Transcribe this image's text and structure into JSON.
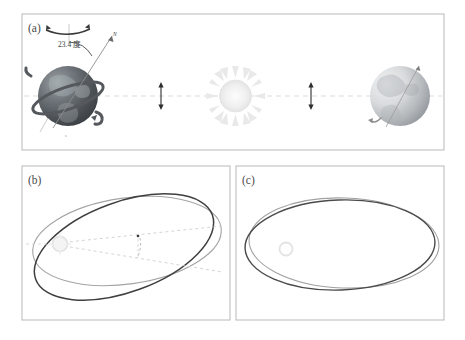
{
  "figure": {
    "background_color": "#ffffff",
    "border_color": "#b9b9b9"
  },
  "panels": [
    {
      "id": "a",
      "label": "(a)",
      "caption": "Earth axial tilt and orbit around the Sun",
      "annotations": {
        "tilt_angle": "23.4 度",
        "north_axis": "N",
        "rotation_arrow": "spin-arrow",
        "orbit_line": "dashed-orbit-line"
      },
      "bodies": [
        {
          "name": "earth-left",
          "kind": "earth",
          "shading": "dark",
          "has_ring": true,
          "has_axis": true
        },
        {
          "name": "sun-center",
          "kind": "sun",
          "shading": "light"
        },
        {
          "name": "earth-right",
          "kind": "earth",
          "shading": "light",
          "has_ring": false,
          "has_axis": true
        }
      ],
      "markers": [
        {
          "name": "amplitude-marker-left",
          "kind": "double-arrow"
        },
        {
          "name": "amplitude-marker-right",
          "kind": "double-arrow"
        }
      ]
    },
    {
      "id": "b",
      "label": "(b)",
      "caption": "Two inclined orbital planes intersecting at an angle, Sun at focus",
      "annotations": {
        "inclination_marker": "dashed-angle-arc",
        "node_line": "dashed-line"
      },
      "bodies": [
        {
          "name": "sun-focus",
          "kind": "sun",
          "shading": "light"
        }
      ],
      "ellipses": [
        {
          "name": "orbit-ellipse-dark",
          "color": "#444444",
          "tilt_deg": -22
        },
        {
          "name": "orbit-ellipse-light",
          "color": "#9a9a9a",
          "tilt_deg": -7
        }
      ]
    },
    {
      "id": "c",
      "label": "(c)",
      "caption": "Two nearly coincident orbital ellipses showing precession",
      "bodies": [
        {
          "name": "sun-focus",
          "kind": "sun",
          "shading": "light"
        }
      ],
      "ellipses": [
        {
          "name": "orbit-ellipse-dark",
          "color": "#4a4a4a",
          "tilt_deg": -2
        },
        {
          "name": "orbit-ellipse-light",
          "color": "#9a9a9a",
          "tilt_deg": 3
        }
      ]
    }
  ],
  "colors": {
    "border": "#b9b9b9",
    "earth_dark": "#4f5255",
    "earth_light": "#c9cbcd",
    "sun": "#ececec",
    "orbit_dashed": "#d8d8d8",
    "ellipse_dark": "#444444",
    "ellipse_light": "#9a9a9a",
    "text": "#4a4a4a"
  }
}
